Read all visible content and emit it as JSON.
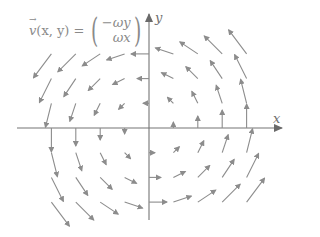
{
  "formula": {
    "lhs_symbol": "v",
    "lhs_args": "(x, y) =",
    "component_1": "−ωy",
    "component_2": "ωx",
    "paren_left": "(",
    "paren_right": ")"
  },
  "axes": {
    "x_label": "x",
    "y_label": "y",
    "color": "#757575"
  },
  "field": {
    "arrow_color": "#8c8c8c",
    "definition": "v(x,y) = (-ωy, ωx)",
    "grid_x": [
      -4,
      -3,
      -2,
      -1,
      0,
      1,
      2,
      3,
      4
    ],
    "grid_y": [
      -3,
      -2,
      -1,
      0,
      1,
      2,
      3
    ]
  },
  "layout": {
    "origin_px": [
      149,
      128
    ],
    "spacing_x": 24.4,
    "spacing_y": 24.7,
    "arrow_scale": 6
  }
}
